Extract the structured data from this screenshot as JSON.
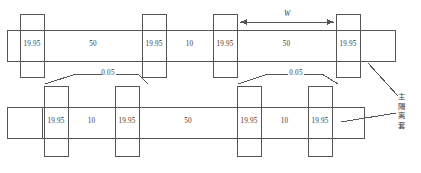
{
  "drawing": {
    "title": "Shaft and isolation sleeve assembly dimension drawing",
    "line_color": "#555555",
    "text_color": "#3a3a3a",
    "background": "#ffffff",
    "units_note": "",
    "upper_row": {
      "name": "upper-shaft-assembly",
      "segments": [
        {
          "label": "19.95",
          "kind": "sleeve"
        },
        {
          "label": "50",
          "kind": "shaft"
        },
        {
          "label": "19.95",
          "kind": "sleeve"
        },
        {
          "label": "10",
          "kind": "shaft"
        },
        {
          "label": "19.95",
          "kind": "sleeve"
        },
        {
          "label": "50",
          "kind": "shaft"
        },
        {
          "label": "19.95",
          "kind": "sleeve"
        }
      ]
    },
    "lower_row": {
      "name": "lower-shaft-assembly",
      "segments": [
        {
          "label": "19.95",
          "kind": "sleeve"
        },
        {
          "label": "10",
          "kind": "shaft"
        },
        {
          "label": "19.95",
          "kind": "sleeve"
        },
        {
          "label": "50",
          "kind": "shaft"
        },
        {
          "label": "19.95",
          "kind": "sleeve"
        },
        {
          "label": "10",
          "kind": "shaft"
        },
        {
          "label": "19.95",
          "kind": "sleeve"
        }
      ]
    },
    "tolerances": [
      {
        "value": "0.05",
        "position": "left"
      },
      {
        "value": "0.05",
        "position": "right"
      }
    ],
    "width_dimension": {
      "label": "W",
      "arrows": "both"
    },
    "callout": {
      "text": "主隔离套",
      "leaders": 2
    }
  }
}
